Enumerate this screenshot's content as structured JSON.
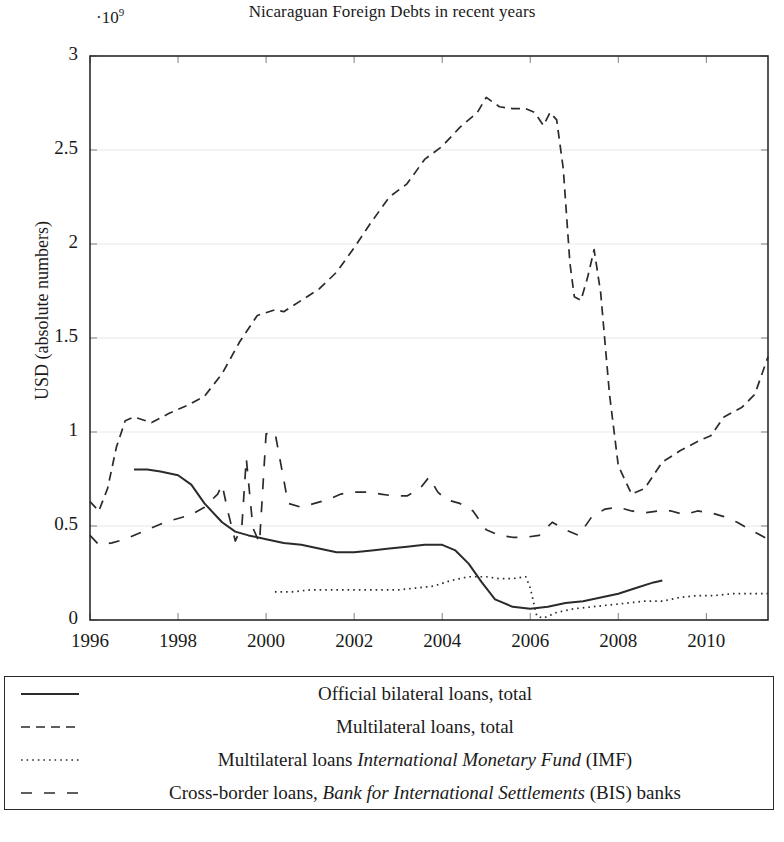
{
  "chart_data": {
    "type": "line",
    "title": "Nicaraguan Foreign Debts in recent years",
    "axis_multiplier": "·10",
    "axis_multiplier_exponent": "9",
    "xlabel": "",
    "ylabel": "USD (absolute numbers)",
    "xlim": [
      1996,
      2011.4
    ],
    "ylim": [
      0,
      3
    ],
    "yticks": [
      "0",
      "0.5",
      "1",
      "1.5",
      "2",
      "2.5",
      "3"
    ],
    "ytick_values": [
      0,
      0.5,
      1,
      1.5,
      2,
      2.5,
      3
    ],
    "xticks": [
      "1996",
      "1998",
      "2000",
      "2002",
      "2004",
      "2006",
      "2008",
      "2010"
    ],
    "xtick_values": [
      1996,
      1998,
      2000,
      2002,
      2004,
      2006,
      2008,
      2010
    ],
    "grid": false,
    "legend_position": "below-plot-boxed",
    "line_color": "#2b2b2b",
    "series": [
      {
        "name": "Official bilateral loans, total",
        "style": "solid",
        "x": [
          1997.0,
          1997.3,
          1997.6,
          1998.0,
          1998.3,
          1998.6,
          1999.0,
          1999.3,
          1999.6,
          2000.0,
          2000.4,
          2000.8,
          2001.2,
          2001.6,
          2002.0,
          2002.4,
          2002.8,
          2003.2,
          2003.6,
          2004.0,
          2004.3,
          2004.6,
          2004.9,
          2005.2,
          2005.6,
          2006.0,
          2006.4,
          2006.8,
          2007.2,
          2007.6,
          2008.0,
          2008.4,
          2008.8,
          2009.0
        ],
        "y": [
          0.8,
          0.8,
          0.79,
          0.77,
          0.72,
          0.62,
          0.52,
          0.47,
          0.45,
          0.43,
          0.41,
          0.4,
          0.38,
          0.36,
          0.36,
          0.37,
          0.38,
          0.39,
          0.4,
          0.4,
          0.37,
          0.3,
          0.2,
          0.11,
          0.07,
          0.06,
          0.07,
          0.09,
          0.1,
          0.12,
          0.14,
          0.17,
          0.2,
          0.21
        ]
      },
      {
        "name": "Multilateral loans, total",
        "style": "dashed",
        "x": [
          1996.0,
          1996.2,
          1996.4,
          1996.6,
          1996.8,
          1997.0,
          1997.4,
          1997.8,
          1998.2,
          1998.6,
          1999.0,
          1999.4,
          1999.8,
          2000.2,
          2000.4,
          2000.8,
          2001.2,
          2001.6,
          2002.0,
          2002.4,
          2002.8,
          2003.2,
          2003.6,
          2004.0,
          2004.4,
          2004.8,
          2005.0,
          2005.3,
          2005.6,
          2005.9,
          2006.1,
          2006.3,
          2006.45,
          2006.6,
          2006.75,
          2006.9,
          2007.0,
          2007.15,
          2007.3,
          2007.45,
          2007.6,
          2007.8,
          2008.0,
          2008.3,
          2008.6,
          2009.0,
          2009.4,
          2009.8,
          2010.1,
          2010.4,
          2010.8,
          2011.1,
          2011.4
        ],
        "y": [
          0.63,
          0.58,
          0.7,
          0.92,
          1.06,
          1.08,
          1.05,
          1.1,
          1.14,
          1.19,
          1.31,
          1.48,
          1.62,
          1.65,
          1.64,
          1.7,
          1.76,
          1.85,
          1.98,
          2.12,
          2.25,
          2.32,
          2.45,
          2.52,
          2.62,
          2.7,
          2.78,
          2.73,
          2.72,
          2.72,
          2.7,
          2.63,
          2.7,
          2.66,
          2.4,
          1.9,
          1.72,
          1.7,
          1.82,
          1.97,
          1.74,
          1.2,
          0.82,
          0.67,
          0.7,
          0.84,
          0.9,
          0.95,
          0.98,
          1.08,
          1.13,
          1.2,
          1.4
        ]
      },
      {
        "name": "Multilateral loans International Monetary Fund (IMF)",
        "style": "dotted",
        "x": [
          2000.2,
          2000.6,
          2001.0,
          2001.4,
          2001.8,
          2002.2,
          2002.6,
          2003.0,
          2003.4,
          2003.8,
          2004.2,
          2004.6,
          2005.0,
          2005.3,
          2005.6,
          2005.9,
          2006.0,
          2006.15,
          2006.3,
          2006.6,
          2007.0,
          2007.4,
          2007.8,
          2008.2,
          2008.6,
          2009.0,
          2009.4,
          2009.8,
          2010.2,
          2010.6,
          2011.0,
          2011.4
        ],
        "y": [
          0.15,
          0.15,
          0.16,
          0.16,
          0.16,
          0.16,
          0.16,
          0.16,
          0.17,
          0.18,
          0.21,
          0.23,
          0.23,
          0.22,
          0.22,
          0.23,
          0.17,
          0.02,
          0.01,
          0.04,
          0.06,
          0.07,
          0.08,
          0.09,
          0.1,
          0.1,
          0.12,
          0.13,
          0.13,
          0.14,
          0.14,
          0.14
        ]
      },
      {
        "name": "Cross-border loans, Bank for International Settlements (BIS) banks",
        "style": "longdash",
        "x": [
          1996.0,
          1996.2,
          1996.5,
          1996.8,
          1997.1,
          1997.4,
          1997.7,
          1998.0,
          1998.3,
          1998.6,
          1998.9,
          1999.0,
          1999.15,
          1999.3,
          1999.45,
          1999.55,
          1999.7,
          1999.85,
          2000.0,
          2000.2,
          2000.5,
          2000.8,
          2001.1,
          2001.4,
          2001.7,
          2002.0,
          2002.3,
          2002.6,
          2002.9,
          2003.2,
          2003.5,
          2003.7,
          2003.9,
          2004.1,
          2004.4,
          2004.7,
          2005.0,
          2005.3,
          2005.6,
          2005.9,
          2006.2,
          2006.5,
          2006.8,
          2007.1,
          2007.4,
          2007.7,
          2008.0,
          2008.3,
          2008.6,
          2008.9,
          2009.2,
          2009.5,
          2009.8,
          2010.1,
          2010.4,
          2010.7,
          2011.0,
          2011.4
        ],
        "y": [
          0.45,
          0.4,
          0.41,
          0.43,
          0.46,
          0.49,
          0.52,
          0.54,
          0.56,
          0.6,
          0.67,
          0.72,
          0.56,
          0.42,
          0.5,
          0.86,
          0.49,
          0.41,
          0.99,
          1.0,
          0.62,
          0.6,
          0.62,
          0.64,
          0.67,
          0.68,
          0.68,
          0.67,
          0.66,
          0.66,
          0.7,
          0.76,
          0.68,
          0.64,
          0.62,
          0.58,
          0.48,
          0.45,
          0.44,
          0.44,
          0.45,
          0.52,
          0.48,
          0.45,
          0.55,
          0.59,
          0.6,
          0.58,
          0.57,
          0.58,
          0.58,
          0.56,
          0.58,
          0.57,
          0.55,
          0.52,
          0.48,
          0.43
        ]
      }
    ]
  },
  "legend": {
    "entries": [
      {
        "style": "solid",
        "prefix": "Official bilateral loans, total",
        "italic": "",
        "suffix": ""
      },
      {
        "style": "dashed",
        "prefix": "Multilateral loans, total",
        "italic": "",
        "suffix": ""
      },
      {
        "style": "dotted",
        "prefix": "Multilateral loans ",
        "italic": "International Monetary Fund",
        "suffix": " (IMF)"
      },
      {
        "style": "longdash",
        "prefix": "Cross-border loans, ",
        "italic": "Bank for International Settlements",
        "suffix": " (BIS) banks"
      }
    ]
  }
}
